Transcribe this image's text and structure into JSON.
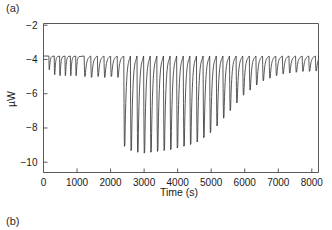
{
  "figure": {
    "panel_a_label": "(a)",
    "panel_b_label": "(b)"
  },
  "chart_data": {
    "type": "line",
    "title": "",
    "xlabel": "Time (s)",
    "ylabel": "µW",
    "xlim": [
      0,
      8200
    ],
    "ylim": [
      -10.6,
      -1.9
    ],
    "xticks": [
      0,
      1000,
      2000,
      3000,
      4000,
      5000,
      6000,
      7000,
      8000
    ],
    "xticklabels": [
      "0",
      "1000",
      "2000",
      "3000",
      "4000",
      "5000",
      "6000",
      "7000",
      "8000"
    ],
    "yticks": [
      -2,
      -4,
      -6,
      -8,
      -10
    ],
    "yticklabels": [
      "−2",
      "−4",
      "−6",
      "−8",
      "−10"
    ],
    "grid": false,
    "legend": null,
    "line_color": "#3a3a3a",
    "baseline": -3.8,
    "peak_width_s": 70,
    "injection_interval_s": 197,
    "first_injection_s": 1248,
    "n_injections": 37,
    "series": [
      {
        "name": "raw heat flow",
        "injection_times": [
          1248,
          1445,
          1642,
          1839,
          2036,
          2233,
          2430,
          2627,
          2824,
          3021,
          3218,
          3415,
          3612,
          3809,
          4006,
          4203,
          4400,
          4597,
          4794,
          4991,
          5188,
          5385,
          5582,
          5779,
          5976,
          6173,
          6370,
          6567,
          6764,
          6961,
          7158,
          7355,
          7552,
          7749,
          7946,
          8143,
          8340
        ],
        "peak_minima": [
          -5.0,
          -5.05,
          -5.0,
          -5.05,
          -5.0,
          -5.05,
          -9.1,
          -9.35,
          -9.45,
          -9.5,
          -9.45,
          -9.4,
          -9.35,
          -9.3,
          -9.2,
          -9.1,
          -9.0,
          -8.85,
          -8.6,
          -8.3,
          -7.9,
          -7.45,
          -7.0,
          -6.55,
          -6.1,
          -5.8,
          -5.5,
          -5.25,
          -5.1,
          -4.95,
          -4.85,
          -4.8,
          -4.75,
          -4.7,
          -4.7,
          -4.68,
          -4.65
        ]
      }
    ],
    "pre_injection_times": [
      180,
      340,
      500,
      660,
      820,
      980
    ],
    "pre_injection_minima": [
      -4.6,
      -4.9,
      -4.95,
      -4.95,
      -4.95,
      -4.95
    ]
  }
}
